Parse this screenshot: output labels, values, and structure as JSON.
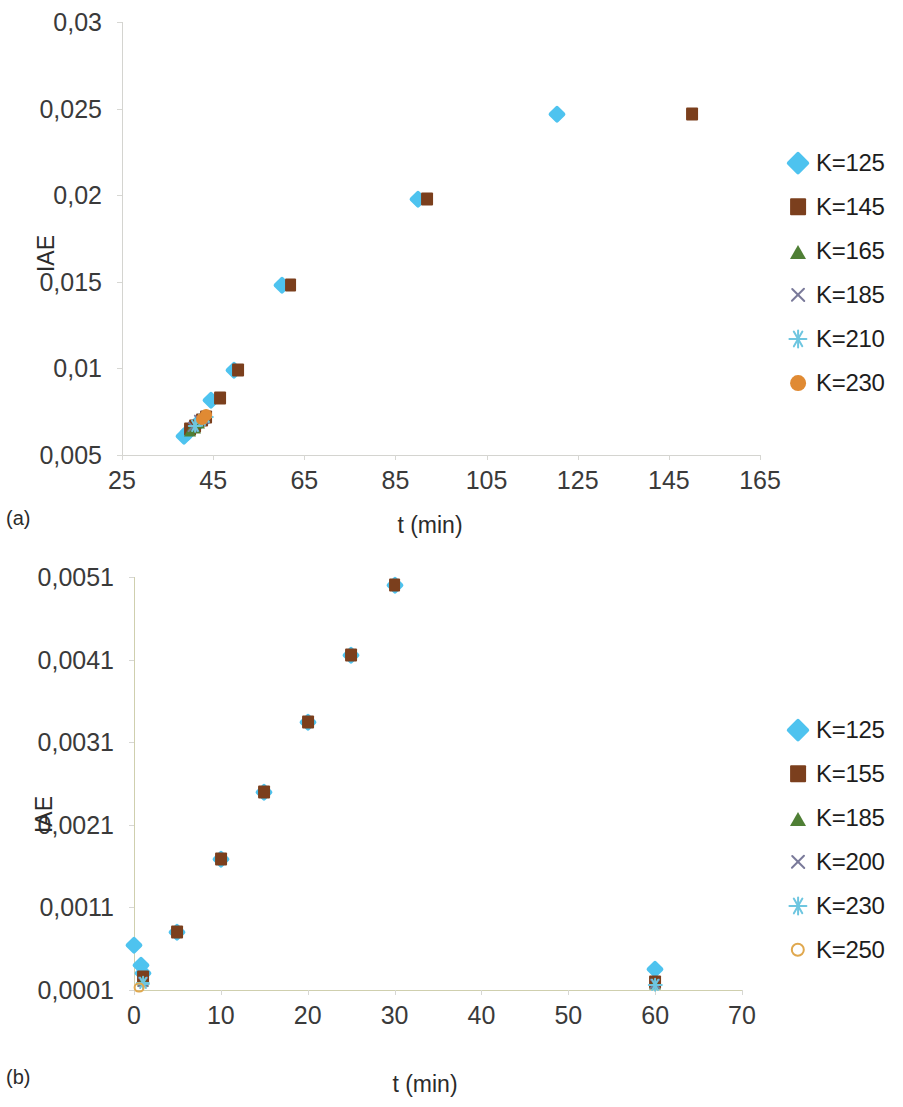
{
  "figure": {
    "panels": [
      {
        "caption": "(a)",
        "xlabel": "t (min)",
        "ylabel": "IAE"
      },
      {
        "caption": "(b)",
        "xlabel": "t (min)",
        "ylabel": "IAE"
      }
    ]
  },
  "chart_data": [
    {
      "type": "scatter",
      "panel": "(a)",
      "title": "",
      "xlabel": "t (min)",
      "ylabel": "IAE",
      "xlim": [
        25,
        165
      ],
      "ylim": [
        0.005,
        0.03
      ],
      "xticks": [
        25,
        45,
        65,
        85,
        105,
        125,
        145,
        165
      ],
      "yticks": [
        0.005,
        0.01,
        0.015,
        0.02,
        0.025,
        0.03
      ],
      "xtick_labels": [
        "25",
        "45",
        "65",
        "85",
        "105",
        "125",
        "145",
        "165"
      ],
      "ytick_labels": [
        "0,005",
        "0,01",
        "0,015",
        "0,02",
        "0,025",
        "0,03"
      ],
      "grid": false,
      "legend_position": "right",
      "decimal_separator": ",",
      "series": [
        {
          "name": "K=125",
          "marker": "diamond",
          "color": "#4ec3ef",
          "points": [
            {
              "x": 38.5,
              "y": 0.0061
            },
            {
              "x": 39.5,
              "y": 0.0063
            },
            {
              "x": 41.5,
              "y": 0.0068
            },
            {
              "x": 44.5,
              "y": 0.0082
            },
            {
              "x": 49.5,
              "y": 0.0099
            },
            {
              "x": 60.0,
              "y": 0.0148
            },
            {
              "x": 90.0,
              "y": 0.0198
            },
            {
              "x": 120.5,
              "y": 0.0247
            }
          ]
        },
        {
          "name": "K=145",
          "marker": "square",
          "color": "#7b3f1d",
          "points": [
            {
              "x": 40.0,
              "y": 0.0065
            },
            {
              "x": 41.0,
              "y": 0.0067
            },
            {
              "x": 42.5,
              "y": 0.007
            },
            {
              "x": 43.5,
              "y": 0.0072
            },
            {
              "x": 46.5,
              "y": 0.0083
            },
            {
              "x": 50.5,
              "y": 0.0099
            },
            {
              "x": 62.0,
              "y": 0.0148
            },
            {
              "x": 92.0,
              "y": 0.0198
            },
            {
              "x": 150.0,
              "y": 0.0247
            }
          ]
        },
        {
          "name": "K=165",
          "marker": "triangle",
          "color": "#4f7f35",
          "points": [
            {
              "x": 40.0,
              "y": 0.0064
            },
            {
              "x": 41.0,
              "y": 0.0066
            },
            {
              "x": 42.0,
              "y": 0.0069
            }
          ]
        },
        {
          "name": "K=185",
          "marker": "cross",
          "color": "#7a7a9a",
          "points": [
            {
              "x": 40.5,
              "y": 0.0066
            },
            {
              "x": 42.0,
              "y": 0.007
            },
            {
              "x": 43.0,
              "y": 0.0071
            }
          ]
        },
        {
          "name": "K=210",
          "marker": "star",
          "color": "#6ec6e0",
          "points": [
            {
              "x": 41.0,
              "y": 0.0067
            },
            {
              "x": 42.5,
              "y": 0.007
            },
            {
              "x": 43.5,
              "y": 0.0072
            }
          ]
        },
        {
          "name": "K=230",
          "marker": "circle",
          "color": "#e08a33",
          "points": [
            {
              "x": 42.5,
              "y": 0.0071
            },
            {
              "x": 43.5,
              "y": 0.0073
            }
          ]
        }
      ]
    },
    {
      "type": "scatter",
      "panel": "(b)",
      "title": "",
      "xlabel": "t (min)",
      "ylabel": "IAE",
      "xlim": [
        0,
        70
      ],
      "ylim": [
        0.0001,
        0.0051
      ],
      "xticks": [
        0,
        10,
        20,
        30,
        40,
        50,
        60,
        70
      ],
      "yticks": [
        0.0001,
        0.0011,
        0.0021,
        0.0031,
        0.0041,
        0.0051
      ],
      "xtick_labels": [
        "0",
        "10",
        "20",
        "30",
        "40",
        "50",
        "60",
        "70"
      ],
      "ytick_labels": [
        "0,0001",
        "0,0011",
        "0,0021",
        "0,0031",
        "0,0041",
        "0,0051"
      ],
      "grid": false,
      "legend_position": "right",
      "decimal_separator": ",",
      "series": [
        {
          "name": "K=125",
          "marker": "diamond",
          "color": "#4ec3ef",
          "points": [
            {
              "x": 0.0,
              "y": 0.00065
            },
            {
              "x": 0.8,
              "y": 0.0004
            },
            {
              "x": 1.0,
              "y": 0.0003
            },
            {
              "x": 5.0,
              "y": 0.0008
            },
            {
              "x": 10.0,
              "y": 0.00168
            },
            {
              "x": 15.0,
              "y": 0.0025
            },
            {
              "x": 20.0,
              "y": 0.00335
            },
            {
              "x": 25.0,
              "y": 0.00415
            },
            {
              "x": 30.0,
              "y": 0.005
            },
            {
              "x": 60.0,
              "y": 0.00035
            }
          ]
        },
        {
          "name": "K=155",
          "marker": "square",
          "color": "#7b3f1d",
          "points": [
            {
              "x": 1.0,
              "y": 0.00026
            },
            {
              "x": 5.0,
              "y": 0.0008
            },
            {
              "x": 10.0,
              "y": 0.00168
            },
            {
              "x": 15.0,
              "y": 0.0025
            },
            {
              "x": 20.0,
              "y": 0.00335
            },
            {
              "x": 25.0,
              "y": 0.00415
            },
            {
              "x": 30.0,
              "y": 0.005
            },
            {
              "x": 60.0,
              "y": 0.0002
            }
          ]
        },
        {
          "name": "K=185",
          "marker": "triangle",
          "color": "#4f7f35",
          "points": [
            {
              "x": 1.0,
              "y": 0.00022
            },
            {
              "x": 60.0,
              "y": 0.00018
            }
          ]
        },
        {
          "name": "K=200",
          "marker": "cross",
          "color": "#7a7a9a",
          "points": [
            {
              "x": 1.0,
              "y": 0.0002
            },
            {
              "x": 60.0,
              "y": 0.00017
            }
          ]
        },
        {
          "name": "K=230",
          "marker": "star",
          "color": "#6ec6e0",
          "points": [
            {
              "x": 1.0,
              "y": 0.00018
            },
            {
              "x": 60.0,
              "y": 0.00016
            }
          ]
        },
        {
          "name": "K=250",
          "marker": "circle-open",
          "color": "#e0a84e",
          "points": [
            {
              "x": 0.6,
              "y": 0.00013
            }
          ]
        }
      ]
    }
  ]
}
